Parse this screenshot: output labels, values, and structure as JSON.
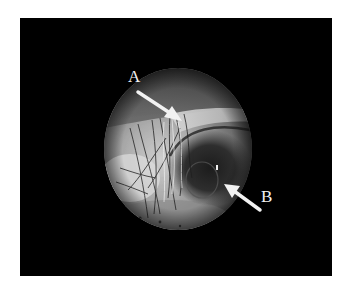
{
  "figure": {
    "background_color": "#000000",
    "page_color": "#ffffff",
    "arrow_color": "#f2f2f2",
    "annotations": [
      {
        "label": "A",
        "points_to": "bright fibrous strands near upper-center of view"
      },
      {
        "label": "B",
        "points_to": "dark rounded structure at right side of view"
      }
    ]
  }
}
